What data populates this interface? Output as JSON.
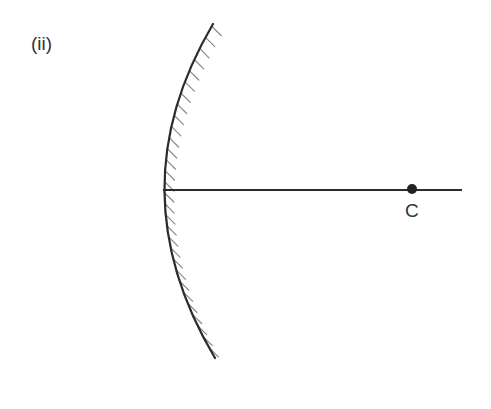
{
  "figure": {
    "part_label": "(ii)",
    "point_label": "C"
  },
  "geometry": {
    "mirror_top": [
      213,
      24
    ],
    "mirror_vertex": [
      163,
      190
    ],
    "mirror_bottom": [
      215,
      358
    ],
    "axis_start": [
      163,
      190
    ],
    "axis_end": [
      462,
      190
    ],
    "centre_point": [
      412,
      189
    ],
    "hatch_spacing": 11,
    "hatch_length": 13
  },
  "colors": {
    "mirror": "#2b2b2b",
    "hatch": "#8a8a8a",
    "axis": "#2b2b2b",
    "point": "#222222",
    "text": "#333333"
  }
}
